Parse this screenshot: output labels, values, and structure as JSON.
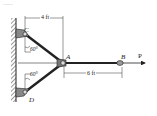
{
  "caption": "........",
  "labels": {
    "C": "C",
    "D": "D",
    "A": "A",
    "B": "B",
    "P": "P"
  },
  "dimensions": {
    "top": "4 ft",
    "bottom": "6 ft"
  },
  "angles": {
    "upper": "60°",
    "lower": "60°"
  },
  "colors": {
    "ink": "#222222",
    "wall": "#666666",
    "background": "#ffffff"
  }
}
